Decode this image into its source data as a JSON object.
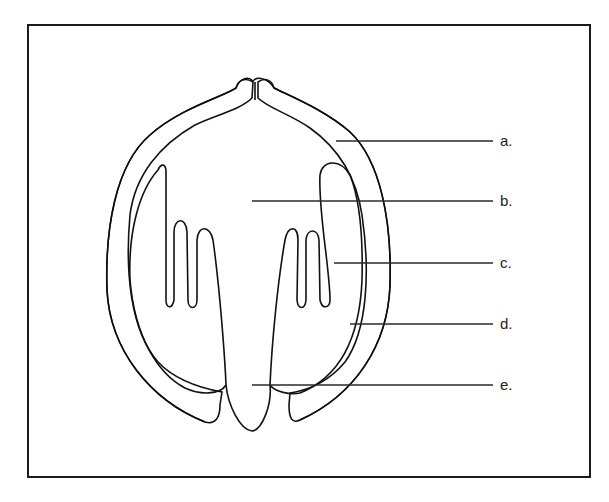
{
  "diagram": {
    "type": "labeled-cross-section",
    "labels": [
      {
        "id": "a",
        "text": "a."
      },
      {
        "id": "b",
        "text": "b."
      },
      {
        "id": "c",
        "text": "c."
      },
      {
        "id": "d",
        "text": "d."
      },
      {
        "id": "e",
        "text": "e."
      }
    ]
  },
  "colors": {
    "background": "#ffffff",
    "ink": "#111111",
    "stipple_dark": "#1a1a1a",
    "stipple_light": "#333333"
  }
}
